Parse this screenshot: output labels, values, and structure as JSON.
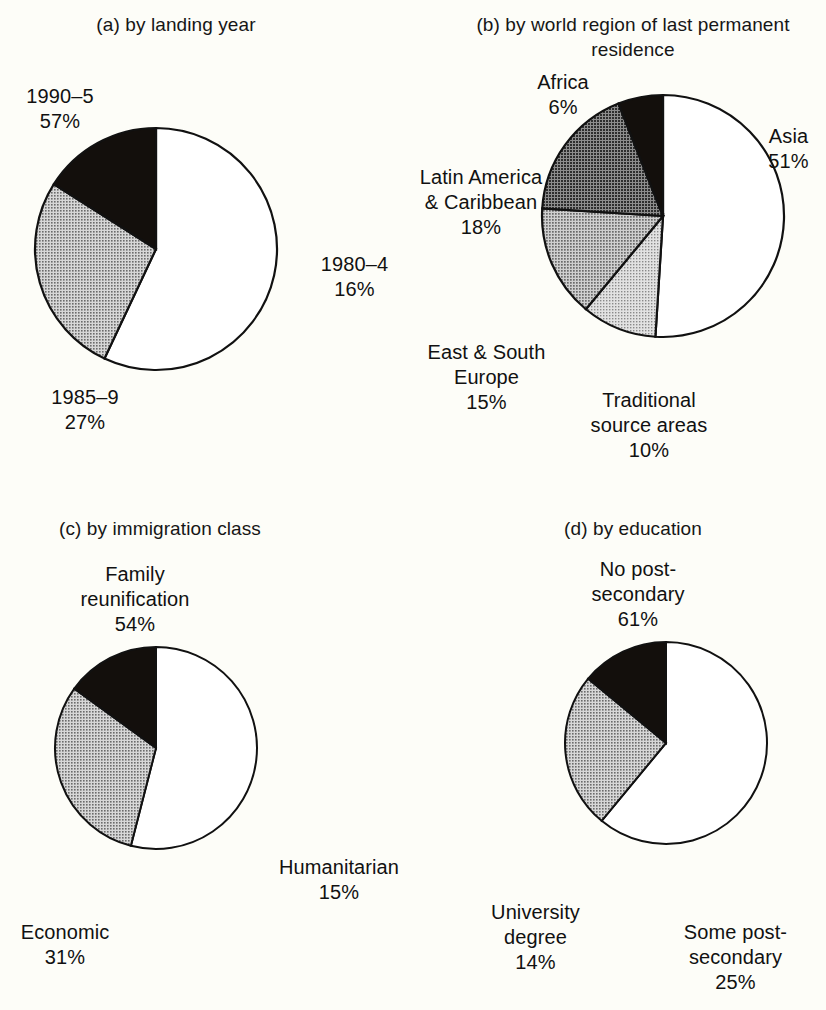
{
  "figure": {
    "background_color": "#fdfdf8",
    "text_color": "#111111"
  },
  "panels": {
    "a": {
      "title": "(a) by landing year",
      "labels": {
        "p1": "1990–5\n57%",
        "p2": "1980–4\n16%",
        "p3": "1985–9\n27%"
      }
    },
    "b": {
      "title": "(b) by world region of last\npermanent residence",
      "labels": {
        "africa": "Africa\n6%",
        "asia": "Asia\n51%",
        "latin": "Latin America\n& Caribbean\n18%",
        "europe": "East & South\nEurope\n15%",
        "traditional": "Traditional\nsource areas\n10%"
      }
    },
    "c": {
      "title": "(c) by immigration class",
      "labels": {
        "family": "Family\nreunification\n54%",
        "humanitarian": "Humanitarian\n15%",
        "economic": "Economic\n31%"
      }
    },
    "d": {
      "title": "(d) by education",
      "labels": {
        "nopost": "No post-\nsecondary\n61%",
        "some": "Some post-\nsecondary\n25%",
        "university": "University\ndegree\n14%"
      }
    }
  },
  "chart_data": [
    {
      "type": "pie",
      "id": "a",
      "title": "(a) by landing year",
      "categories": [
        "1990–5",
        "1985–9",
        "1980–4"
      ],
      "values": [
        57,
        27,
        16
      ],
      "unit": "%",
      "start_angle_deg": 0,
      "direction": "clockwise",
      "slice_fills": [
        "#ffffff",
        "#a8a8a8",
        "#130f0c"
      ],
      "legend": "labels-outside"
    },
    {
      "type": "pie",
      "id": "b",
      "title": "(b) by world region of last permanent residence",
      "categories": [
        "Asia",
        "Traditional source areas",
        "East & South Europe",
        "Latin America & Caribbean",
        "Africa"
      ],
      "values": [
        51,
        10,
        15,
        18,
        6
      ],
      "unit": "%",
      "start_angle_deg": 0,
      "direction": "clockwise",
      "slice_fills": [
        "#ffffff",
        "#bdbdbd",
        "#a0a0a0",
        "#6e6e6e",
        "#130f0c"
      ],
      "legend": "labels-outside"
    },
    {
      "type": "pie",
      "id": "c",
      "title": "(c) by immigration class",
      "categories": [
        "Family reunification",
        "Economic",
        "Humanitarian"
      ],
      "values": [
        54,
        31,
        15
      ],
      "unit": "%",
      "start_angle_deg": 0,
      "direction": "clockwise",
      "slice_fills": [
        "#ffffff",
        "#a8a8a8",
        "#130f0c"
      ],
      "legend": "labels-outside"
    },
    {
      "type": "pie",
      "id": "d",
      "title": "(d) by education",
      "categories": [
        "No post-secondary",
        "Some post-secondary",
        "University degree"
      ],
      "values": [
        61,
        25,
        14
      ],
      "unit": "%",
      "start_angle_deg": 0,
      "direction": "clockwise",
      "slice_fills": [
        "#ffffff",
        "#a8a8a8",
        "#130f0c"
      ],
      "legend": "labels-outside"
    }
  ]
}
